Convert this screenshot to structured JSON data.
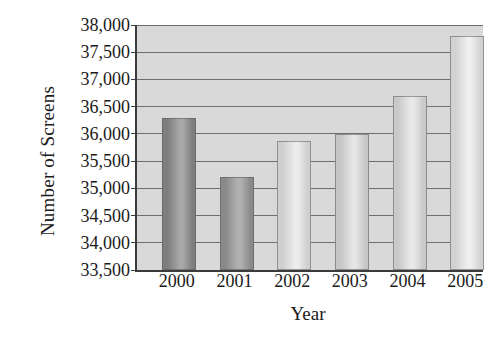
{
  "chart_data": {
    "type": "bar",
    "title": "",
    "xlabel": "Year",
    "ylabel": "Number of Screens",
    "categories": [
      "2000",
      "2001",
      "2002",
      "2003",
      "2004",
      "2005"
    ],
    "values": [
      36300,
      35200,
      35870,
      36000,
      36700,
      37800
    ],
    "ylim": [
      33500,
      38000
    ],
    "ytick_values": [
      33500,
      34000,
      34500,
      35000,
      35500,
      36000,
      36500,
      37000,
      37500,
      38000
    ],
    "ytick_labels": [
      "33,500",
      "34,000",
      "34,500",
      "35,000",
      "35,500",
      "36,000",
      "36,500",
      "37,000",
      "37,500",
      "38,000"
    ],
    "grid": true,
    "legend": "none",
    "bar_colors": [
      "#7e7e7e",
      "#8a8a8a",
      "#cfcfcf",
      "#c6c6c6",
      "#c9c9c9",
      "#d2d2d2"
    ],
    "bar_highlight_colors": [
      "#a8a8a8",
      "#b0b0b0",
      "#ececec",
      "#e6e6e6",
      "#e9e9e9",
      "#efefef"
    ],
    "plot_background": "#d9d9d9",
    "gridline_color": "#6e6e6e",
    "axis_color": "#3b3b3b"
  }
}
